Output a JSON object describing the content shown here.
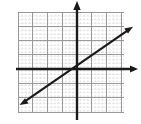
{
  "figure": {
    "width": 141,
    "height": 124,
    "background_color": "#ffffff",
    "title": ""
  },
  "chart_data": {
    "type": "line",
    "title": "",
    "subtitle": "",
    "xlabel": "",
    "ylabel": "",
    "xlim": [
      -4,
      3.25
    ],
    "ylim": [
      -3,
      4
    ],
    "grid": true,
    "grid_major_step": 1,
    "grid_minor_step": 0.25,
    "legend": "none",
    "annotations": [],
    "tick_labels": {
      "x": [],
      "y": []
    },
    "series": [
      {
        "name": "line",
        "slope": 0.6,
        "intercept": 0,
        "equation": "y = 0.6x",
        "x": [
          -3.85,
          3.7
        ],
        "y": [
          -2.31,
          2.22
        ],
        "arrow_start": true,
        "arrow_end": true,
        "color": "#1a1a1a",
        "width": 2.2
      }
    ],
    "axes": {
      "x_axis": {
        "y_value": 0,
        "arrow_end": true,
        "arrow_start": false,
        "color": "#1a1a1a"
      },
      "y_axis": {
        "x_value": 0,
        "arrow_end": true,
        "arrow_start": false,
        "color": "#1a1a1a"
      }
    }
  },
  "colors": {
    "axis": "#1a1a1a",
    "line": "#1a1a1a",
    "grid_major": "#8e8e8e",
    "grid_minor": "#c4c4c4",
    "background": "#ffffff"
  },
  "geometry": {
    "plot_left": 18,
    "plot_top": 12,
    "plot_right": 124,
    "plot_bottom": 112,
    "origin_x": 77,
    "origin_y": 69,
    "cell_px": 14.6,
    "x_axis_left_end": 16,
    "x_axis_right_end": 138,
    "y_axis_top_end": 2,
    "y_axis_bottom_end": 120,
    "line_x1": 21,
    "line_y1": 104,
    "line_x2": 131,
    "line_y2": 28
  }
}
